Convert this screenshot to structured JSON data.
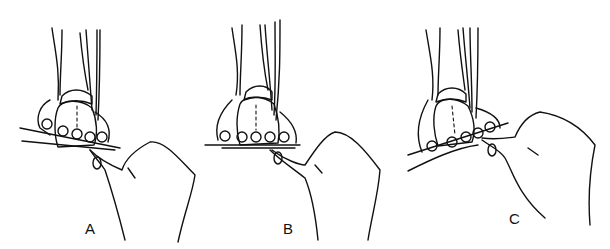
{
  "figure": {
    "panels": [
      {
        "id": "A",
        "label": "A",
        "forefoot_tilt": "rotated"
      },
      {
        "id": "B",
        "label": "B",
        "forefoot_tilt": "neutral"
      },
      {
        "id": "C",
        "label": "C",
        "forefoot_tilt": "rotated-opposite"
      }
    ],
    "colors": {
      "line": "#111111",
      "background": "#ffffff"
    }
  }
}
